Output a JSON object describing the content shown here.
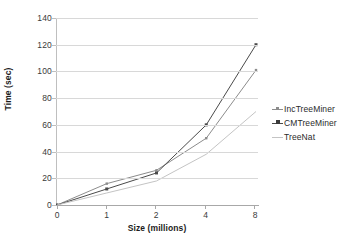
{
  "chart_data": {
    "type": "line",
    "title": "",
    "xlabel": "Size (millions)",
    "ylabel": "Time (sec)",
    "categories": [
      "0",
      "1",
      "2",
      "4",
      "8"
    ],
    "xtick_labels": [
      "0",
      "1",
      "2",
      "4",
      "8"
    ],
    "ytick_labels": [
      "0",
      "20",
      "40",
      "60",
      "80",
      "100",
      "120",
      "140"
    ],
    "ylim": [
      0,
      140
    ],
    "ystep": 20,
    "grid": "horizontal",
    "legend_position": "right",
    "series": [
      {
        "name": "IncTreeMiner",
        "values": [
          0,
          16,
          26,
          50,
          101
        ],
        "color": "#8c8c8c",
        "marker": "small-square"
      },
      {
        "name": "CMTreeMiner",
        "values": [
          0,
          12,
          24,
          60,
          120
        ],
        "color": "#4a4a4a",
        "marker": "filled-square"
      },
      {
        "name": "TreeNat",
        "values": [
          0,
          9,
          18,
          38,
          70
        ],
        "color": "#c4c4c4",
        "marker": "none"
      }
    ]
  },
  "legend": {
    "items": [
      {
        "label": "IncTreeMiner"
      },
      {
        "label": "CMTreeMiner"
      },
      {
        "label": "TreeNat"
      }
    ]
  }
}
